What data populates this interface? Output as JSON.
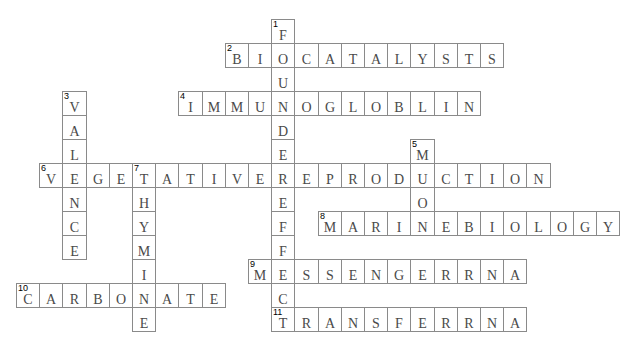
{
  "puzzle": {
    "grid": {
      "origin_x": 16,
      "origin_y": 19,
      "cell_w": 23.2,
      "cell_h": 24
    },
    "entries": [
      {
        "number": 1,
        "direction": "down",
        "answer": "FOUNDEREFFECT",
        "row": 0,
        "col": 11
      },
      {
        "number": 2,
        "direction": "across",
        "answer": "BIOCATALYSTS",
        "row": 1,
        "col": 9
      },
      {
        "number": 3,
        "direction": "down",
        "answer": "VALENCE",
        "row": 3,
        "col": 2
      },
      {
        "number": 4,
        "direction": "across",
        "answer": "IMMUNOGLOBLIN",
        "row": 3,
        "col": 7
      },
      {
        "number": 5,
        "direction": "down",
        "answer": "MUON",
        "row": 5,
        "col": 17
      },
      {
        "number": 6,
        "direction": "across",
        "answer": "VEGETATIVEREPRODUCTION",
        "row": 6,
        "col": 1
      },
      {
        "number": 7,
        "direction": "down",
        "answer": "THYMINE",
        "row": 6,
        "col": 5
      },
      {
        "number": 8,
        "direction": "across",
        "answer": "MARINEBIOLOGY",
        "row": 8,
        "col": 13
      },
      {
        "number": 9,
        "direction": "across",
        "answer": "MESSENGERRNA",
        "row": 10,
        "col": 10
      },
      {
        "number": 10,
        "direction": "across",
        "answer": "CARBONATE",
        "row": 11,
        "col": 0
      },
      {
        "number": 11,
        "direction": "across",
        "answer": "TRANSFERRNA",
        "row": 12,
        "col": 11
      }
    ]
  },
  "colors": {
    "border": "#8a8a8a",
    "letter": "#4a4a4a",
    "number": "#000000"
  }
}
